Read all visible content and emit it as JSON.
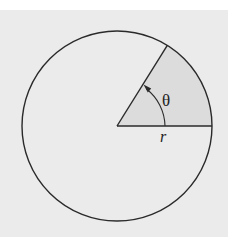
{
  "diagram": {
    "colors": {
      "background": "#ebebeb",
      "top_band": "#ffffff",
      "sector_fill": "#dcdcdc",
      "stroke": "#2a2a2a"
    },
    "circle": {
      "cx": 117,
      "cy": 126,
      "r": 95
    },
    "sector": {
      "start_angle_deg": 0,
      "end_angle_deg": 58
    },
    "angle_arc": {
      "r": 48,
      "arrow_direction": "counterclockwise"
    },
    "labels": {
      "angle": "θ",
      "radius": "r"
    }
  }
}
